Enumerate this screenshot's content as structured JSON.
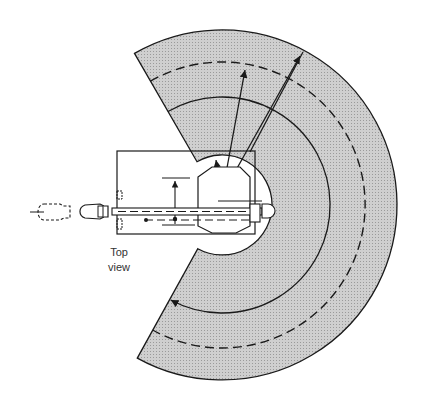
{
  "caption": {
    "line1": "Top",
    "line2": "view"
  },
  "colors": {
    "workspace_fill": "#c8c8c8",
    "line": "#1a1a1a",
    "background": "#ffffff"
  },
  "geometry": {
    "center": [
      222,
      205
    ],
    "outer_radius": 175,
    "dashed_outer_radius": 143,
    "solid_inner_radius": 108,
    "cutout_radius": 50,
    "start_angle_deg": -120,
    "end_angle_deg": 119
  }
}
